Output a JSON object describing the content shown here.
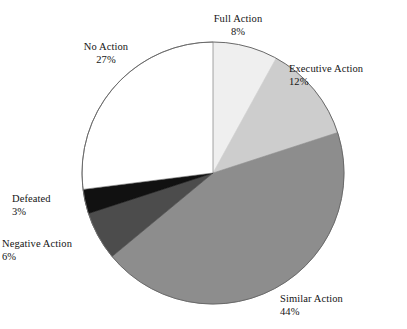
{
  "chart_data": {
    "type": "pie",
    "title": "",
    "subtitle": "",
    "xlabel": "",
    "ylabel": "",
    "legend_position": "none",
    "grid": false,
    "labels_outside": true,
    "start_angle_deg": 0,
    "direction": "clockwise",
    "categories": [
      "Full Action",
      "Executive Action",
      "Similar Action",
      "Negative Action",
      "Defeated",
      "No Action"
    ],
    "values": [
      8,
      12,
      44,
      6,
      3,
      27
    ],
    "value_suffix": "%",
    "colors": [
      "#efefef",
      "#cdcdcd",
      "#8d8d8d",
      "#4c4c4c",
      "#111111",
      "#ffffff"
    ],
    "slices": [
      {
        "label": "Full Action",
        "value": 8,
        "value_text": "8%",
        "color": "#efefef"
      },
      {
        "label": "Executive Action",
        "value": 12,
        "value_text": "12%",
        "color": "#cdcdcd"
      },
      {
        "label": "Similar Action",
        "value": 44,
        "value_text": "44%",
        "color": "#8d8d8d"
      },
      {
        "label": "Negative Action",
        "value": 6,
        "value_text": "6%",
        "color": "#4c4c4c"
      },
      {
        "label": "Defeated",
        "value": 3,
        "value_text": "3%",
        "color": "#111111"
      },
      {
        "label": "No Action",
        "value": 27,
        "value_text": "27%",
        "color": "#ffffff"
      }
    ]
  },
  "labels": {
    "full_action": {
      "name": "Full Action",
      "value": "8%"
    },
    "executive_action": {
      "name": "Executive Action",
      "value": "12%"
    },
    "similar_action": {
      "name": "Similar Action",
      "value": "44%"
    },
    "negative_action": {
      "name": "Negative Action",
      "value": "6%"
    },
    "defeated": {
      "name": "Defeated",
      "value": "3%"
    },
    "no_action": {
      "name": "No Action",
      "value": "27%"
    }
  },
  "geometry": {
    "center_x": 213,
    "center_y": 173,
    "radius": 131,
    "outline_color": "#6a6a6a"
  }
}
